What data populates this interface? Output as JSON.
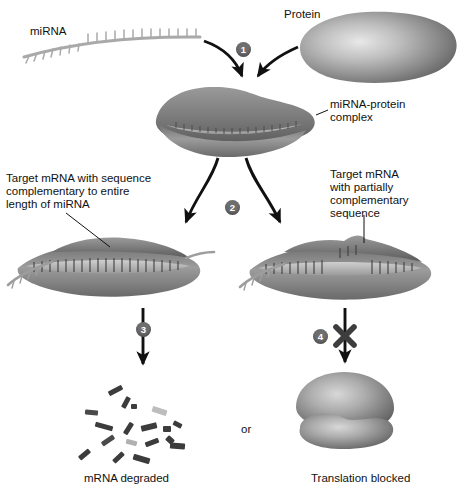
{
  "figure": {
    "background_color": "#ffffff",
    "ink_color": "#111111",
    "blob_gray": "#8d8d8d",
    "badge_color": "#6e6e6e"
  },
  "labels": {
    "mirna": "miRNA",
    "protein": "Protein",
    "complex_line1": "miRNA-protein",
    "complex_line2": "complex",
    "left_target_line1": "Target mRNA with sequence",
    "left_target_line2": "complementary to entire",
    "left_target_line3": "length of miRNA",
    "right_target_line1": "Target mRNA",
    "right_target_line2": "with partially",
    "right_target_line3": "complementary",
    "right_target_line4": "sequence",
    "or": "or",
    "outcome_left": "mRNA degraded",
    "outcome_right": "Translation blocked"
  },
  "steps": [
    {
      "id": "1",
      "label": "1",
      "meaning": "miRNA binds protein to form complex"
    },
    {
      "id": "2",
      "label": "2",
      "meaning": "complex binds target mRNA"
    },
    {
      "id": "3",
      "label": "3",
      "meaning": "full complementarity leads to degradation"
    },
    {
      "id": "4",
      "label": "4",
      "meaning": "partial complementarity blocks translation"
    }
  ],
  "fragments": [
    {
      "x": 108,
      "y": 388,
      "w": 15,
      "h": 5,
      "rot": -28,
      "shade": "#3c3c3c"
    },
    {
      "x": 131,
      "y": 404,
      "w": 6,
      "h": 5,
      "rot": 0,
      "shade": "#3c3c3c"
    },
    {
      "x": 85,
      "y": 410,
      "w": 13,
      "h": 5,
      "rot": 6,
      "shade": "#4a4a4a"
    },
    {
      "x": 120,
      "y": 400,
      "w": 12,
      "h": 5,
      "rot": -62,
      "shade": "#3c3c3c"
    },
    {
      "x": 152,
      "y": 408,
      "w": 15,
      "h": 6,
      "rot": 18,
      "shade": "#bdbdbd"
    },
    {
      "x": 95,
      "y": 424,
      "w": 18,
      "h": 5,
      "rot": 16,
      "shade": "#3c3c3c"
    },
    {
      "x": 122,
      "y": 426,
      "w": 13,
      "h": 5,
      "rot": -58,
      "shade": "#3c3c3c"
    },
    {
      "x": 141,
      "y": 424,
      "w": 16,
      "h": 6,
      "rot": -14,
      "shade": "#3c3c3c"
    },
    {
      "x": 163,
      "y": 426,
      "w": 8,
      "h": 6,
      "rot": 0,
      "shade": "#3c3c3c"
    },
    {
      "x": 173,
      "y": 422,
      "w": 9,
      "h": 5,
      "rot": 28,
      "shade": "#3c3c3c"
    },
    {
      "x": 101,
      "y": 438,
      "w": 14,
      "h": 5,
      "rot": -34,
      "shade": "#4a4a4a"
    },
    {
      "x": 126,
      "y": 440,
      "w": 11,
      "h": 5,
      "rot": 14,
      "shade": "#b0b0b0"
    },
    {
      "x": 145,
      "y": 440,
      "w": 14,
      "h": 5,
      "rot": -20,
      "shade": "#3c3c3c"
    },
    {
      "x": 166,
      "y": 437,
      "w": 8,
      "h": 6,
      "rot": 42,
      "shade": "#3c3c3c"
    },
    {
      "x": 170,
      "y": 443,
      "w": 15,
      "h": 6,
      "rot": 4,
      "shade": "#3c3c3c"
    },
    {
      "x": 78,
      "y": 452,
      "w": 13,
      "h": 5,
      "rot": -40,
      "shade": "#3c3c3c"
    },
    {
      "x": 112,
      "y": 455,
      "w": 13,
      "h": 5,
      "rot": -44,
      "shade": "#3c3c3c"
    },
    {
      "x": 133,
      "y": 456,
      "w": 17,
      "h": 6,
      "rot": 16,
      "shade": "#3c3c3c"
    }
  ]
}
